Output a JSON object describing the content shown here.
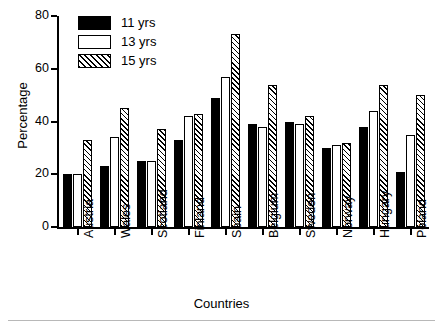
{
  "chart_data": {
    "type": "bar",
    "title": "",
    "xlabel": "Countries",
    "ylabel": "Percentage",
    "ylim": [
      0,
      80
    ],
    "yticks": [
      0,
      20,
      40,
      60,
      80
    ],
    "grid": false,
    "legend_position": "top-left",
    "categories": [
      "Austria",
      "Wales",
      "Scotland",
      "Finland",
      "Spain",
      "Belgium",
      "Sweden",
      "Norway",
      "Hungary",
      "Poland"
    ],
    "series": [
      {
        "name": "11 yrs",
        "fill": "solid-black",
        "color": "#000000",
        "values": [
          20,
          23,
          25,
          33,
          49,
          39,
          40,
          30,
          38,
          21
        ]
      },
      {
        "name": "13 yrs",
        "fill": "white",
        "color": "#ffffff",
        "values": [
          20,
          34,
          25,
          42,
          57,
          38,
          39,
          31,
          44,
          35
        ]
      },
      {
        "name": "15 yrs",
        "fill": "diagonal-hatch",
        "color": "#ffffff",
        "values": [
          33,
          45,
          37,
          43,
          73,
          54,
          42,
          32,
          54,
          50
        ]
      }
    ]
  }
}
